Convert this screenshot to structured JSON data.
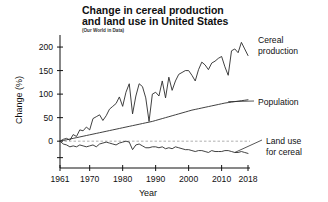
{
  "chart_data": {
    "type": "line",
    "title": "Change in cereal production and land use in United States",
    "title_line1": "Change in cereal production",
    "title_line2": "and land use in United States",
    "subtitle": "(Our World in Data)",
    "xlabel": "Year",
    "ylabel": "Change (%)",
    "xlim": [
      1961,
      2018
    ],
    "ylim": [
      -40,
      215
    ],
    "grid": false,
    "legend_position": "right-inline-annotations",
    "zero_reference_line": 0,
    "xticks": [
      1961,
      1970,
      1980,
      1990,
      2000,
      2010,
      2018
    ],
    "xtick_labels": [
      "1961",
      "1970",
      "1980",
      "1990",
      "2000",
      "2010",
      "2018"
    ],
    "yticks": [
      0,
      50,
      100,
      150,
      200
    ],
    "ytick_labels": [
      "0",
      "50",
      "100",
      "150",
      "200"
    ],
    "x": [
      1961,
      1962,
      1963,
      1964,
      1965,
      1966,
      1967,
      1968,
      1969,
      1970,
      1971,
      1972,
      1973,
      1974,
      1975,
      1976,
      1977,
      1978,
      1979,
      1980,
      1981,
      1982,
      1983,
      1984,
      1985,
      1986,
      1987,
      1988,
      1989,
      1990,
      1991,
      1992,
      1993,
      1994,
      1995,
      1996,
      1997,
      1998,
      1999,
      2000,
      2001,
      2002,
      2003,
      2004,
      2005,
      2006,
      2007,
      2008,
      2009,
      2010,
      2011,
      2012,
      2013,
      2014,
      2015,
      2016,
      2017,
      2018
    ],
    "series": [
      {
        "name": "Cereal production",
        "label_line1": "Cereal",
        "label_line2": "production",
        "values": [
          0,
          4,
          6,
          2,
          14,
          10,
          24,
          22,
          30,
          24,
          48,
          52,
          56,
          44,
          54,
          68,
          74,
          80,
          94,
          74,
          104,
          122,
          58,
          96,
          122,
          116,
          92,
          42,
          100,
          104,
          96,
          128,
          92,
          136,
          108,
          128,
          142,
          146,
          150,
          150,
          140,
          128,
          152,
          168,
          162,
          152,
          166,
          170,
          176,
          180,
          158,
          140,
          192,
          196,
          188,
          210,
          196,
          182
        ]
      },
      {
        "name": "Population",
        "label_line1": "Population",
        "label_line2": "",
        "values": [
          0,
          1.5,
          3,
          4.5,
          6,
          7.5,
          9,
          10.5,
          12,
          13.5,
          15,
          16.5,
          18,
          19.5,
          21,
          22.5,
          24,
          25.5,
          27,
          28.5,
          30,
          31.5,
          33,
          34.5,
          36,
          37.5,
          39,
          40.5,
          42,
          44,
          46,
          48,
          50,
          52,
          54,
          56,
          58,
          60,
          62,
          64,
          66,
          67.5,
          69,
          70.5,
          72,
          73.5,
          75,
          76.5,
          78,
          79.5,
          81,
          82,
          83,
          84,
          85,
          86,
          87,
          88
        ]
      },
      {
        "name": "Land use for cereal",
        "label_line1": "Land use",
        "label_line2": "for cereal",
        "values": [
          0,
          -6,
          -8,
          -12,
          -10,
          -12,
          -8,
          -10,
          -12,
          -10,
          -8,
          -12,
          -6,
          -4,
          -2,
          -4,
          -6,
          -8,
          -4,
          -2,
          0,
          -2,
          -18,
          -8,
          -6,
          -10,
          -14,
          -14,
          -12,
          -12,
          -14,
          -12,
          -16,
          -14,
          -16,
          -12,
          -14,
          -16,
          -18,
          -18,
          -20,
          -22,
          -20,
          -20,
          -22,
          -24,
          -20,
          -22,
          -22,
          -22,
          -20,
          -20,
          -22,
          -24,
          -24,
          -22,
          -24,
          -26
        ]
      }
    ]
  }
}
